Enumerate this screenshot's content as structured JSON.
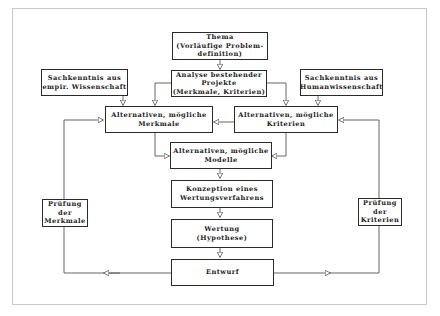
{
  "diagram": {
    "boxes": {
      "thema": "Thema\n(Vorläufige Problem-\ndefinition)",
      "analyse": "Analyse bestehender\nProjekte\n(Merkmale, Kriterien)",
      "sach_empir": "Sachkenntnis aus\nempir. Wissenschaft",
      "sach_human": "Sachkenntnis aus\nHumanwissenschaft",
      "alt_merkmale": "Alternativen, mögliche\nMerkmale",
      "alt_kriterien": "Alternativen, mögliche\nKriterien",
      "alt_modelle": "Alternativen, mögliche\nModelle",
      "konzeption": "Konzeption eines\nWertungsverfahrens",
      "wertung": "Wertung\n(Hypothese)",
      "entwurf": "Entwurf",
      "pruefung_merkmale": "Prüfung\nder\nMerkmale",
      "pruefung_kriterien": "Prüfung\nder\nKriterien"
    },
    "connections": [
      {
        "from": "thema",
        "to": "analyse"
      },
      {
        "from": "analyse",
        "to": "alt_merkmale"
      },
      {
        "from": "analyse",
        "to": "alt_kriterien"
      },
      {
        "from": "sach_empir",
        "to": "alt_merkmale"
      },
      {
        "from": "sach_human",
        "to": "alt_kriterien"
      },
      {
        "from": "alt_merkmale",
        "to": "alt_kriterien",
        "bidirectional": true
      },
      {
        "from": "alt_merkmale",
        "to": "alt_modelle"
      },
      {
        "from": "alt_kriterien",
        "to": "alt_modelle"
      },
      {
        "from": "alt_modelle",
        "to": "konzeption"
      },
      {
        "from": "konzeption",
        "to": "wertung"
      },
      {
        "from": "wertung",
        "to": "entwurf"
      },
      {
        "from": "entwurf",
        "to": "pruefung_merkmale"
      },
      {
        "from": "entwurf",
        "to": "pruefung_kriterien"
      },
      {
        "from": "pruefung_merkmale",
        "to": "alt_merkmale"
      },
      {
        "from": "pruefung_kriterien",
        "to": "alt_kriterien"
      }
    ]
  }
}
